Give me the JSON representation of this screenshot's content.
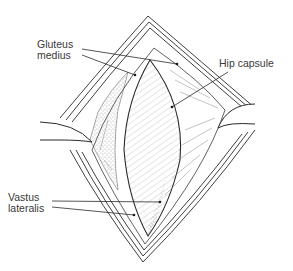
{
  "figure": {
    "labels": [
      {
        "id": "gluteus-medius",
        "lines": [
          "Gluteus",
          "medius"
        ]
      },
      {
        "id": "hip-capsule",
        "lines": [
          "Hip capsule"
        ]
      },
      {
        "id": "vastus-lateralis",
        "lines": [
          "Vastus",
          "lateralis"
        ]
      }
    ],
    "colors": {
      "ink": "#2a2a2a",
      "text": "#3a3a3a",
      "background": "#ffffff"
    }
  }
}
